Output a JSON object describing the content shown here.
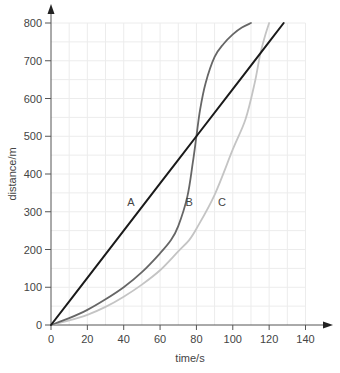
{
  "chart_data": {
    "type": "line",
    "title": "",
    "xlabel": "time/s",
    "ylabel": "distance/m",
    "xlim": [
      0,
      140
    ],
    "ylim": [
      0,
      800
    ],
    "xticks": [
      0,
      20,
      40,
      60,
      80,
      100,
      120,
      140
    ],
    "yticks": [
      0,
      100,
      200,
      300,
      400,
      500,
      600,
      700,
      800
    ],
    "grid": {
      "on": true,
      "x_minor_step": 10,
      "y_minor_step": 50
    },
    "legend": "none (inline series labels)",
    "series": [
      {
        "name": "A",
        "color": "#1a1a1a",
        "label_pos": {
          "x": 44,
          "y": 325
        },
        "x": [
          0,
          20,
          40,
          60,
          80,
          100,
          120,
          128
        ],
        "y": [
          0,
          125,
          250,
          375,
          500,
          625,
          750,
          800
        ]
      },
      {
        "name": "B",
        "color": "#666666",
        "label_pos": {
          "x": 76,
          "y": 325
        },
        "x": [
          0,
          10,
          20,
          30,
          40,
          50,
          60,
          66,
          70,
          75,
          78,
          80,
          82,
          85,
          90,
          95,
          100,
          105,
          110
        ],
        "y": [
          0,
          18,
          40,
          68,
          100,
          140,
          190,
          225,
          262,
          340,
          430,
          500,
          570,
          640,
          710,
          745,
          770,
          788,
          800
        ]
      },
      {
        "name": "C",
        "color": "#c4c4c4",
        "label_pos": {
          "x": 94,
          "y": 325
        },
        "x": [
          0,
          10,
          20,
          30,
          40,
          50,
          60,
          70,
          76,
          80,
          90,
          100,
          107,
          112,
          115,
          118,
          120
        ],
        "y": [
          0,
          12,
          27,
          48,
          75,
          107,
          145,
          195,
          225,
          255,
          345,
          465,
          545,
          640,
          715,
          770,
          800
        ]
      }
    ]
  }
}
